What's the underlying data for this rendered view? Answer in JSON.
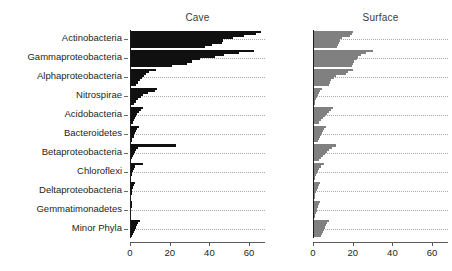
{
  "chart_data": {
    "type": "bar",
    "orientation": "horizontal",
    "title": "",
    "xlabel": "",
    "ylabel": "",
    "xlim": [
      0,
      68
    ],
    "xticks": [
      0,
      20,
      40,
      60
    ],
    "xtick_labels": [
      "0",
      "20",
      "40",
      "60"
    ],
    "grid": true,
    "grid_style": "dotted",
    "legend": "none",
    "panels": [
      {
        "name": "cave-panel",
        "title": "Cave",
        "color": "#101010",
        "categories": [
          "Actinobacteria",
          "Gammaproteobacteria",
          "Alphaproteobacteria",
          "Nitrospirae",
          "Acidobacteria",
          "Bacteroidetes",
          "Betaproteobacteria",
          "Chloroflexi",
          "Deltaproteobacteria",
          "Gemmatimonadetes",
          "Minor Phyla"
        ],
        "series_per_category": [
          [
            66.0,
            63.5,
            57.5,
            52.0,
            47.0,
            46.5,
            41.5,
            38.0
          ],
          [
            62.5,
            55.0,
            47.5,
            43.0,
            35.5,
            31.0,
            28.5,
            21.0
          ],
          [
            13.0,
            9.5,
            8.0,
            7.0,
            6.0,
            5.0,
            4.0,
            3.0
          ],
          [
            13.5,
            12.5,
            9.0,
            6.5,
            5.5,
            4.0,
            3.0,
            2.0
          ],
          [
            6.5,
            5.5,
            4.5,
            3.5,
            3.0,
            2.5,
            2.0,
            1.5
          ],
          [
            4.5,
            3.5,
            3.0,
            2.5,
            2.0,
            1.8,
            1.2,
            0.8
          ],
          [
            23.0,
            4.0,
            3.0,
            2.5,
            2.0,
            1.5,
            1.0,
            0.6
          ],
          [
            6.5,
            2.5,
            2.0,
            1.5,
            1.2,
            0.9,
            0.6,
            0.4
          ],
          [
            2.5,
            2.0,
            1.5,
            1.2,
            1.0,
            0.8,
            0.5,
            0.3
          ],
          [
            1.2,
            1.0,
            0.8,
            0.6,
            0.5,
            0.4,
            0.3,
            0.2
          ],
          [
            5.0,
            4.0,
            3.5,
            3.0,
            2.5,
            2.0,
            1.5,
            1.0
          ]
        ]
      },
      {
        "name": "surface-panel",
        "title": "Surface",
        "color": "#808080",
        "categories": [
          "Actinobacteria",
          "Gammaproteobacteria",
          "Alphaproteobacteria",
          "Nitrospirae",
          "Acidobacteria",
          "Bacteroidetes",
          "Betaproteobacteria",
          "Chloroflexi",
          "Deltaproteobacteria",
          "Gemmatimonadetes",
          "Minor Phyla"
        ],
        "series_per_category": [
          [
            20.0,
            19.5,
            18.5,
            14.5,
            13.5,
            13.0,
            12.5,
            12.0
          ],
          [
            30.0,
            26.5,
            24.0,
            22.5,
            22.0,
            20.5,
            20.0,
            19.5
          ],
          [
            20.0,
            17.5,
            16.5,
            11.5,
            10.5,
            9.0,
            8.5,
            8.0
          ],
          [
            4.5,
            3.5,
            3.0,
            2.5,
            2.0,
            1.5,
            1.2,
            0.8
          ],
          [
            10.0,
            9.0,
            8.0,
            7.0,
            6.0,
            5.0,
            4.0,
            3.0
          ],
          [
            6.5,
            5.5,
            5.0,
            4.5,
            4.0,
            3.5,
            3.0,
            2.5
          ],
          [
            11.5,
            9.5,
            8.0,
            7.0,
            6.0,
            5.0,
            4.0,
            3.0
          ],
          [
            5.5,
            4.0,
            3.0,
            2.5,
            2.0,
            1.5,
            1.2,
            1.0
          ],
          [
            3.5,
            3.0,
            2.5,
            2.0,
            1.5,
            1.2,
            1.0,
            0.8
          ],
          [
            3.5,
            3.0,
            2.5,
            2.0,
            1.8,
            1.5,
            1.2,
            1.0
          ],
          [
            8.0,
            7.0,
            6.5,
            6.0,
            5.5,
            5.0,
            4.5,
            4.0
          ]
        ]
      }
    ]
  }
}
